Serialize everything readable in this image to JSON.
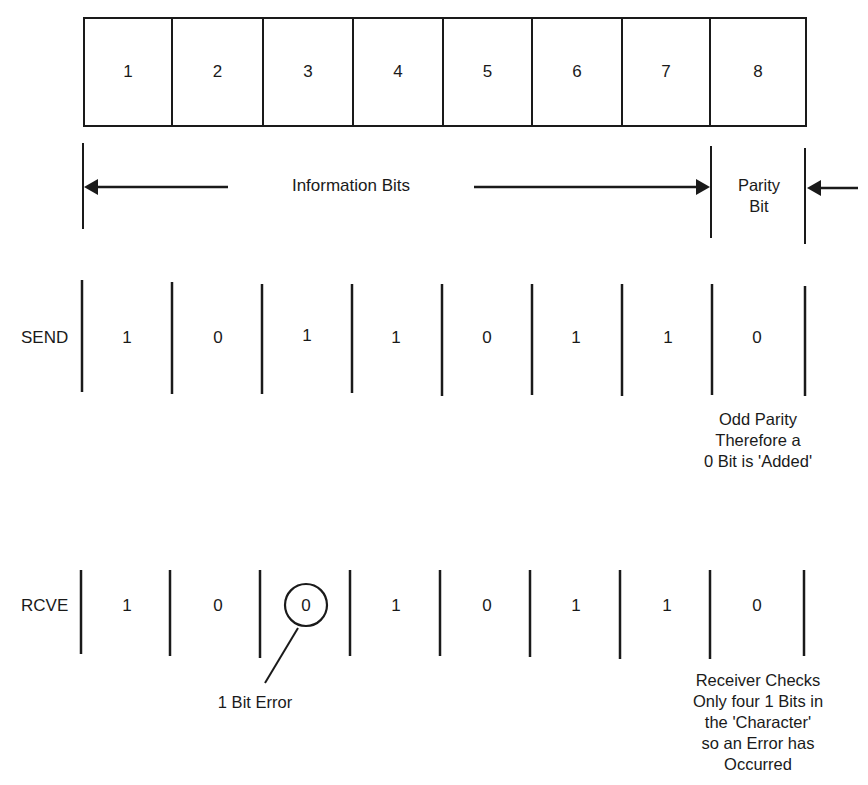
{
  "diagram": {
    "character_cells": [
      "1",
      "2",
      "3",
      "4",
      "5",
      "6",
      "7",
      "8"
    ],
    "labels": {
      "information_bits": "Information Bits",
      "parity_bit_line1": "Parity",
      "parity_bit_line2": "Bit"
    },
    "send": {
      "label": "SEND",
      "bits": [
        "1",
        "0",
        "1",
        "1",
        "0",
        "1",
        "1",
        "0"
      ],
      "note_lines": [
        "Odd Parity",
        "Therefore a",
        "0 Bit is 'Added'"
      ]
    },
    "receive": {
      "label": "RCVE",
      "bits": [
        "1",
        "0",
        "0",
        "1",
        "0",
        "1",
        "1",
        "0"
      ],
      "error_bit_index": 2,
      "error_label": "1 Bit Error",
      "note_lines": [
        "Receiver Checks",
        "Only four 1 Bits in",
        "the 'Character'",
        "so an Error has",
        "Occurred"
      ]
    },
    "colors": {
      "ink": "#1a1a1a",
      "background": "#ffffff"
    }
  }
}
